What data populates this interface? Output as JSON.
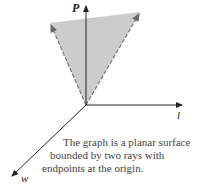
{
  "axes": {
    "p_label": "P",
    "l_label": "l",
    "w_label": "w"
  },
  "caption": {
    "line1": "The graph is a planar surface",
    "line2": "bounded by two rays with",
    "line3": "endpoints at the origin."
  },
  "colors": {
    "surface_fill": "#cccccc",
    "ray_stroke": "#777777",
    "axis_stroke": "#222222"
  }
}
